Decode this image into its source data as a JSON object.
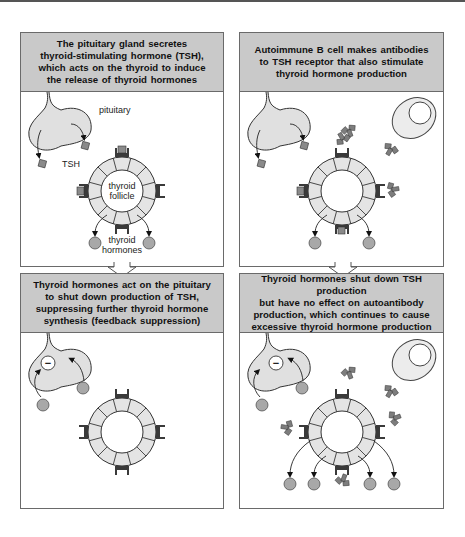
{
  "figure": {
    "panels": [
      {
        "id": "normal-stimulation",
        "caption": "The pituitary gland secretes\nthyroid-stimulating hormone (TSH),\nwhich acts on the thyroid to induce\nthe release of thyroid hormones",
        "labels": {
          "pituitary": "pituitary",
          "tsh": "TSH",
          "follicle_line1": "thyroid",
          "follicle_line2": "follicle",
          "hormones_line1": "thyroid",
          "hormones_line2": "hormones"
        }
      },
      {
        "id": "autoimmune-stimulation",
        "caption": "Autoimmune B cell makes antibodies\nto TSH receptor that also stimulate\nthyroid hormone production"
      },
      {
        "id": "normal-feedback",
        "caption": "Thyroid hormones act on the pituitary\nto shut down production of TSH,\nsuppressing further thyroid hormone\nsynthesis (feedback suppression)",
        "inhibition_symbol": "−"
      },
      {
        "id": "autoimmune-feedback-failure",
        "caption": "Thyroid hormones shut down TSH production\nbut have no effect on autoantibody\nproduction, which continues to cause\nexcessive thyroid hormone production",
        "inhibition_symbol": "−"
      }
    ],
    "colors": {
      "header_fill": "#c9c9c9",
      "cell_fill": "#e4e4e4",
      "hormone_fill": "#a8a8a8",
      "receptor_fill": "#3a3a3a",
      "tsh_fill": "#8a8a8a",
      "antibody_fill": "#7d7d7d",
      "outline": "#333333"
    }
  }
}
